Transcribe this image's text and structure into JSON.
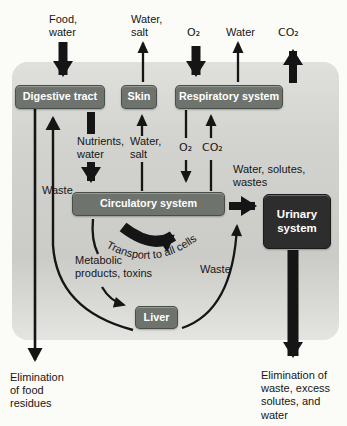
{
  "colors": {
    "panel": "#d2d2ce",
    "box": "#6e746d",
    "boxdark": "#2d2d2d",
    "arrow": "#151515",
    "ink": "#161616"
  },
  "top_labels": {
    "food_water": "Food,\nwater",
    "water_salt": "Water,\nsalt",
    "o2": "O₂",
    "water": "Water",
    "co2": "CO₂"
  },
  "boxes": {
    "digestive": "Digestive tract",
    "skin": "Skin",
    "respiratory": "Respiratory system",
    "circulatory": "Circulatory system",
    "liver": "Liver",
    "urinary": "Urinary\nsystem"
  },
  "inner_labels": {
    "nutrients_water": "Nutrients,\nwater",
    "water_salt": "Water,\nsalt",
    "o2": "O₂",
    "co2": "CO₂",
    "waste_left": "Waste",
    "water_solutes_wastes": "Water, solutes,\nwastes",
    "transport": "Transport to all cells",
    "metabolic": "Metabolic\nproducts, toxins",
    "waste_right": "Waste"
  },
  "bottom_labels": {
    "elimination_left": "Elimination\nof food\nresidues",
    "elimination_right": "Elimination of\nwaste, excess\nsolutes, and\nwater"
  }
}
